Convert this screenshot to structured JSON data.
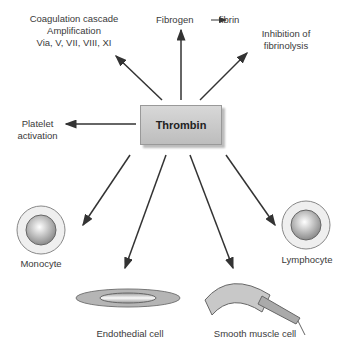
{
  "center": {
    "label": "Thrombin"
  },
  "effects": {
    "coagulation": {
      "line1": "Coagulation cascade",
      "line2": "Amplification",
      "line3": "Via, V, VII, VIII, XI"
    },
    "fibrin": {
      "from": "Fibrogen",
      "to": "fibrin"
    },
    "fibrinolysis": {
      "line1": "Inhibition of",
      "line2": "fibrinolysis"
    },
    "platelet": {
      "line1": "Platelet",
      "line2": "activation"
    }
  },
  "cells": {
    "monocyte": "Monocyte",
    "lymphocyte": "Lymphocyte",
    "endothelial": "Endothedial cell",
    "smooth_muscle": "Smooth muscle cell"
  }
}
